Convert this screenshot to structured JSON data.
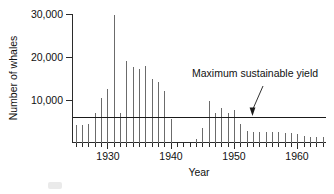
{
  "chart_data": {
    "type": "bar",
    "title": "",
    "xlabel": "Year",
    "ylabel": "Number of whales",
    "xlim": [
      1924.5,
      1964.5
    ],
    "ylim": [
      0,
      31500
    ],
    "grid": false,
    "legend": "none",
    "ytick_labels": [
      "10,000",
      "20,000",
      "30,000"
    ],
    "ytick_values": [
      10000,
      20000,
      30000
    ],
    "xtick_labels": [
      "1930",
      "1940",
      "1950",
      "1960"
    ],
    "xtick_values": [
      1930,
      1940,
      1950,
      1960
    ],
    "minor_xticks": "every year from 1925 to 1964",
    "categories": [
      1925,
      1926,
      1927,
      1928,
      1929,
      1930,
      1931,
      1932,
      1933,
      1934,
      1935,
      1936,
      1937,
      1938,
      1939,
      1940,
      1941,
      1942,
      1943,
      1944,
      1945,
      1946,
      1947,
      1948,
      1949,
      1950,
      1951,
      1952,
      1953,
      1954,
      1955,
      1956,
      1957,
      1958,
      1959,
      1960,
      1961,
      1962,
      1963,
      1964
    ],
    "values": [
      4100,
      4100,
      4400,
      6800,
      10400,
      12500,
      30000,
      6900,
      19200,
      17800,
      17200,
      18000,
      14800,
      14200,
      12000,
      5500,
      0,
      0,
      0,
      900,
      3400,
      9700,
      6800,
      8200,
      7000,
      7600,
      4400,
      2700,
      2500,
      2500,
      2500,
      2400,
      2400,
      2300,
      2300,
      2100,
      1500,
      1400,
      1300,
      1200
    ],
    "series": [
      {
        "name": "Antarctic blue whale catch",
        "values": [
          4100,
          4100,
          4400,
          6800,
          10400,
          12500,
          30000,
          6900,
          19200,
          17800,
          17200,
          18000,
          14800,
          14200,
          12000,
          5500,
          0,
          0,
          0,
          900,
          3400,
          9700,
          6800,
          8200,
          7000,
          7600,
          4400,
          2700,
          2500,
          2500,
          2500,
          2400,
          2400,
          2300,
          2300,
          2100,
          1500,
          1400,
          1300,
          1200
        ]
      }
    ],
    "annotations": [
      {
        "text": "Maximum sustainable yield",
        "value": 6000,
        "kind": "horizontal-reference-line-with-arrow"
      }
    ],
    "reference_line": {
      "label": "Maximum sustainable yield",
      "y_value": 6000
    }
  },
  "axes": {
    "y_title": "Number of whales",
    "x_title": "Year"
  },
  "annotation": {
    "label": "Maximum sustainable yield"
  },
  "ylabels": {
    "t30": "30,000",
    "t20": "20,000",
    "t10": "10,000"
  },
  "xlabels": {
    "y1930": "1930",
    "y1940": "1940",
    "y1950": "1950",
    "y1960": "1960"
  },
  "colors": {
    "bar": "#6b6b6b",
    "axis": "#2b2b2b",
    "annotation": "#1a1a1a",
    "background": "#ffffff"
  }
}
